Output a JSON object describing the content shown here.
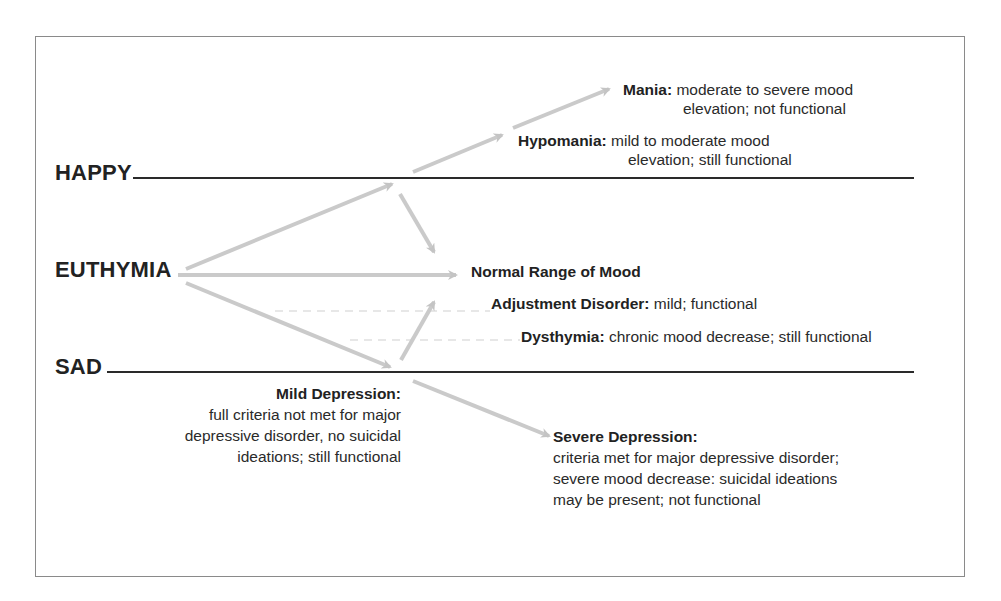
{
  "axis": {
    "happy": "HAPPY",
    "euthymia": "EUTHYMIA",
    "sad": "SAD"
  },
  "states": {
    "mania": {
      "term": "Mania:",
      "desc_line1": "moderate to severe mood",
      "desc_line2": "elevation; not functional"
    },
    "hypomania": {
      "term": "Hypomania:",
      "desc_line1": "mild to moderate mood",
      "desc_line2": "elevation; still functional"
    },
    "normal": {
      "term": "Normal Range of Mood"
    },
    "adjustment": {
      "term": "Adjustment Disorder:",
      "desc": "mild; functional"
    },
    "dysthymia": {
      "term": "Dysthymia:",
      "desc": "chronic mood decrease; still functional"
    },
    "mild_depression": {
      "term": "Mild Depression:",
      "desc_line1": "full criteria not met for major",
      "desc_line2": "depressive disorder, no suicidal",
      "desc_line3": "ideations; still functional"
    },
    "severe_depression": {
      "term": "Severe Depression:",
      "desc_line1": "criteria met for major depressive disorder;",
      "desc_line2": "severe mood decrease:  suicidal ideations",
      "desc_line3": "may be present; not functional"
    }
  },
  "colors": {
    "line": "#2a2a2a",
    "arrow": "#c8c8c8",
    "dashed": "#c8c8c8",
    "frame": "#8a8a8a"
  }
}
